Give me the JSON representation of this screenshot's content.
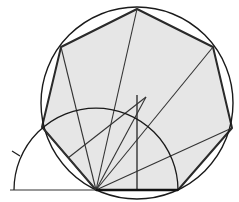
{
  "diagram": {
    "colors": {
      "background": "#ffffff",
      "heptagon_fill": "#e6e6e6",
      "stroke": "#1a1a1a",
      "construction_stroke": "#2a2a2a"
    },
    "circumcircle": {
      "cx": 137,
      "cy": 103,
      "r": 96
    },
    "heptagon_vertices": [
      [
        96,
        190
      ],
      [
        178,
        190
      ],
      [
        232,
        128
      ],
      [
        213,
        47
      ],
      [
        137,
        9
      ],
      [
        61,
        47
      ],
      [
        42,
        127
      ]
    ],
    "construction_arc": {
      "cx": 96,
      "cy": 190,
      "r": 82
    },
    "baseline": {
      "x1": 10,
      "y1": 190,
      "x2": 178,
      "y2": 190
    },
    "vertical_line": {
      "x1": 137,
      "y1": 95,
      "x2": 137,
      "y2": 190
    },
    "diagonals_from_pivot": [
      [
        61,
        47
      ],
      [
        137,
        9
      ],
      [
        213,
        47
      ],
      [
        232,
        128
      ],
      [
        146,
        97
      ],
      [
        42,
        127
      ]
    ],
    "partial_line": {
      "x1": 68,
      "y1": 158,
      "x2": 146,
      "y2": 97
    },
    "tick_mark": {
      "x1": 12,
      "y1": 151,
      "x2": 20,
      "y2": 156
    }
  }
}
